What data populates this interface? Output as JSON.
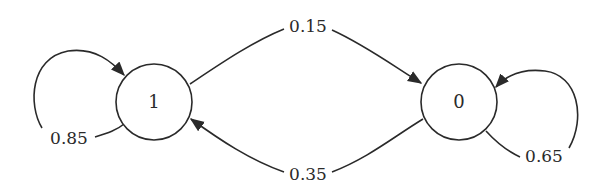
{
  "diagram": {
    "type": "state-transition",
    "nodes": [
      {
        "id": "1",
        "label": "1"
      },
      {
        "id": "0",
        "label": "0"
      }
    ],
    "edges": [
      {
        "from": "1",
        "to": "1",
        "label": "0.85"
      },
      {
        "from": "1",
        "to": "0",
        "label": "0.15"
      },
      {
        "from": "0",
        "to": "1",
        "label": "0.35"
      },
      {
        "from": "0",
        "to": "0",
        "label": "0.65"
      }
    ]
  }
}
